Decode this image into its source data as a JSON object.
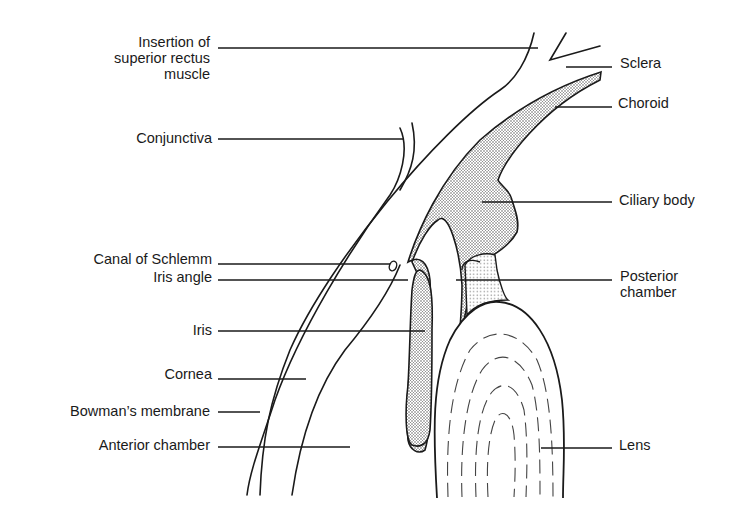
{
  "diagram": {
    "colors": {
      "line": "#1a1a1a",
      "background": "#ffffff",
      "stipple": "#555555"
    },
    "labels_left": [
      {
        "id": "insertion",
        "lines": [
          "Insertion of",
          "superior rectus",
          "muscle"
        ]
      },
      {
        "id": "conjunctiva",
        "text": "Conjunctiva"
      },
      {
        "id": "canal",
        "text": "Canal of Schlemm"
      },
      {
        "id": "iris-angle",
        "text": "Iris angle"
      },
      {
        "id": "iris",
        "text": "Iris"
      },
      {
        "id": "cornea",
        "text": "Cornea"
      },
      {
        "id": "bowman",
        "text": "Bowman’s membrane"
      },
      {
        "id": "anterior-chamber",
        "text": "Anterior chamber"
      }
    ],
    "labels_right": [
      {
        "id": "sclera",
        "text": "Sclera"
      },
      {
        "id": "choroid",
        "text": "Choroid"
      },
      {
        "id": "ciliary",
        "text": "Ciliary body"
      },
      {
        "id": "posterior",
        "lines": [
          "Posterior",
          "chamber"
        ]
      },
      {
        "id": "lens",
        "text": "Lens"
      }
    ]
  }
}
